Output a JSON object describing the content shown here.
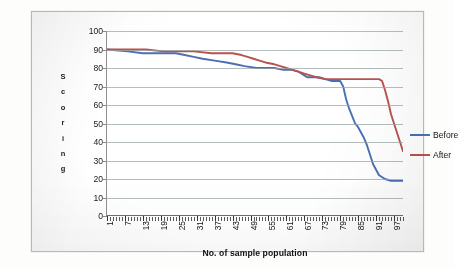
{
  "chart_data": {
    "type": "line",
    "title": "",
    "xlabel": "No. of sample population",
    "ylabel": "Scoring",
    "ylim": [
      0,
      100
    ],
    "xlim": [
      1,
      100
    ],
    "ytick_labels": [
      "100",
      "90",
      "80",
      "70",
      "60",
      "50",
      "40",
      "30",
      "20",
      "10",
      "0"
    ],
    "ytick_values": [
      100,
      90,
      80,
      70,
      60,
      50,
      40,
      30,
      20,
      10,
      0
    ],
    "xtick_labels": [
      "1",
      "7",
      "13",
      "19",
      "25",
      "31",
      "37",
      "43",
      "49",
      "55",
      "61",
      "67",
      "73",
      "79",
      "85",
      "91",
      "97"
    ],
    "xtick_values": [
      1,
      7,
      13,
      19,
      25,
      31,
      37,
      43,
      49,
      55,
      61,
      67,
      73,
      79,
      85,
      91,
      97
    ],
    "grid": true,
    "grid_axis": "y",
    "legend_position": "right",
    "minor_ticks_x": true,
    "series": [
      {
        "name": "Before",
        "color": "#4a6fb5",
        "x": [
          1,
          4,
          7,
          10,
          13,
          16,
          19,
          22,
          25,
          28,
          31,
          34,
          37,
          40,
          43,
          46,
          49,
          52,
          55,
          58,
          61,
          64,
          67,
          68,
          70,
          72,
          73,
          76,
          79,
          82,
          84,
          85,
          86,
          88,
          90,
          91,
          93,
          95,
          97,
          99,
          100
        ],
        "values": [
          90,
          90,
          89,
          89,
          88,
          88,
          88,
          88,
          88,
          87,
          86,
          85,
          84,
          84,
          83,
          82,
          81,
          80,
          80,
          80,
          79,
          79,
          78,
          76,
          75,
          75,
          75,
          75,
          74,
          74,
          73,
          73,
          73,
          73,
          73,
          72,
          72,
          73,
          73,
          73,
          73
        ]
      },
      {
        "name": "After",
        "color": "#b8524f",
        "x": [
          1,
          4,
          7,
          10,
          13,
          16,
          19,
          22,
          25,
          28,
          31,
          34,
          37,
          40,
          43,
          46,
          49,
          52,
          55,
          58,
          61,
          64,
          67,
          70,
          73,
          76,
          79,
          82,
          85,
          88,
          91,
          93,
          94,
          95,
          96,
          97,
          98,
          99,
          100
        ],
        "values": [
          90,
          90,
          90,
          90,
          90,
          89,
          89,
          89,
          89,
          89,
          89,
          88,
          88,
          88,
          88,
          87,
          86,
          85,
          84,
          83,
          81,
          79,
          77,
          76,
          75,
          74,
          74,
          74,
          74,
          74,
          74,
          74,
          73,
          66,
          60,
          52,
          48,
          44,
          35
        ]
      }
    ],
    "series_plotted": {
      "before": [
        [
          1,
          90
        ],
        [
          8,
          89
        ],
        [
          13,
          88
        ],
        [
          24,
          88
        ],
        [
          27,
          87
        ],
        [
          30,
          86
        ],
        [
          33,
          85
        ],
        [
          37,
          84
        ],
        [
          41,
          83
        ],
        [
          44,
          82
        ],
        [
          47,
          81
        ],
        [
          51,
          80
        ],
        [
          57,
          80
        ],
        [
          60,
          79
        ],
        [
          63,
          79
        ],
        [
          65,
          78
        ],
        [
          66,
          77
        ],
        [
          67,
          76
        ],
        [
          68,
          75
        ],
        [
          72,
          75
        ],
        [
          74,
          74
        ],
        [
          76,
          73
        ],
        [
          79,
          73
        ],
        [
          80,
          70
        ],
        [
          81,
          63
        ],
        [
          82,
          58
        ],
        [
          83,
          54
        ],
        [
          84,
          50
        ],
        [
          85,
          48
        ],
        [
          86,
          45
        ],
        [
          87,
          42
        ],
        [
          88,
          38
        ],
        [
          89,
          33
        ],
        [
          90,
          28
        ],
        [
          91,
          25
        ],
        [
          92,
          22
        ],
        [
          94,
          20
        ],
        [
          96,
          19
        ],
        [
          100,
          19
        ]
      ],
      "after": [
        [
          1,
          90
        ],
        [
          14,
          90
        ],
        [
          20,
          89
        ],
        [
          30,
          89
        ],
        [
          36,
          88
        ],
        [
          43,
          88
        ],
        [
          46,
          87
        ],
        [
          48,
          86
        ],
        [
          50,
          85
        ],
        [
          52,
          84
        ],
        [
          54,
          83
        ],
        [
          57,
          82
        ],
        [
          59,
          81
        ],
        [
          61,
          80
        ],
        [
          63,
          79
        ],
        [
          65,
          78
        ],
        [
          67,
          77
        ],
        [
          69,
          76
        ],
        [
          71,
          75
        ],
        [
          74,
          74
        ],
        [
          92,
          74
        ],
        [
          93,
          73
        ],
        [
          94,
          68
        ],
        [
          95,
          62
        ],
        [
          96,
          55
        ],
        [
          97,
          50
        ],
        [
          98,
          45
        ],
        [
          99,
          40
        ],
        [
          100,
          35
        ]
      ]
    }
  },
  "legend": {
    "entries": [
      {
        "label": "Before",
        "color": "#4a6fb5"
      },
      {
        "label": "After",
        "color": "#b8524f"
      }
    ]
  },
  "axes": {
    "y_title_letters": [
      "S",
      "c",
      "o",
      "r",
      "i",
      "n",
      "g"
    ],
    "x_title": "No. of sample population"
  }
}
